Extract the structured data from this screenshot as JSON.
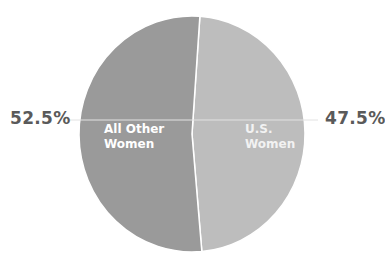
{
  "chart_data": {
    "type": "pie",
    "title": "",
    "slices": [
      {
        "label": "U.S. Women",
        "value": 47.5,
        "display": "47.5%",
        "color": "#bdbdbd"
      },
      {
        "label": "All Other Women",
        "value": 52.5,
        "display": "52.5%",
        "color": "#9a9a9a"
      }
    ],
    "start_angle_deg": 0,
    "direction": "clockwise",
    "legend": "none",
    "labels": {
      "left_pct": "52.5%",
      "right_pct": "47.5%",
      "left_slice_line1": "All Other",
      "left_slice_line2": "Women",
      "right_slice_line1": "U.S.",
      "right_slice_line2": "Women"
    },
    "colors": {
      "us_women": "#bdbdbd",
      "other_women": "#9a9a9a",
      "leader_line": "#d0d0d0",
      "pct_text": "#5a5a5a"
    }
  }
}
